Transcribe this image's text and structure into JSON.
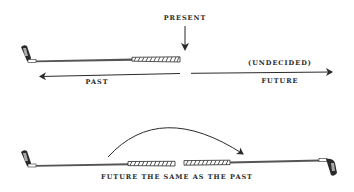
{
  "diagram": {
    "top": {
      "present_label": "PRESENT",
      "past_label": "PAST",
      "undecided_label": "(UNDECIDED)",
      "future_label": "FUTURE"
    },
    "bottom": {
      "caption": "FUTURE THE SAME AS THE PAST"
    },
    "colors": {
      "ink": "#2a2a2a",
      "background": "#ffffff"
    }
  }
}
